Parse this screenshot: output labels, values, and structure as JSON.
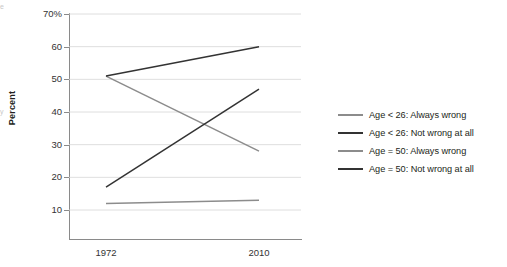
{
  "chart_data": {
    "type": "line",
    "title": "",
    "subtitle": "",
    "xlabel": "",
    "ylabel": "Percent",
    "x": [
      "1972",
      "2010"
    ],
    "categories": [
      "1972",
      "2010"
    ],
    "xlim": [
      0,
      1
    ],
    "ylim": [
      10,
      70
    ],
    "y_ticks": [
      10,
      20,
      30,
      40,
      50,
      60,
      70
    ],
    "y_tick_labels": [
      "10",
      "20",
      "30",
      "40",
      "50",
      "60",
      "70%"
    ],
    "x_tick_labels": [
      "1972",
      "2010"
    ],
    "grid": "horizontal",
    "legend_position": "right",
    "series": [
      {
        "name": "Age < 26: Always wrong",
        "color": "#8c8c8c",
        "values": [
          51,
          28
        ]
      },
      {
        "name": "Age < 26: Not wrong at all",
        "color": "#333333",
        "values": [
          17,
          47
        ]
      },
      {
        "name": "Age = 50: Always wrong",
        "color": "#8c8c8c",
        "values": [
          12,
          13
        ]
      },
      {
        "name": "Age = 50: Not wrong at all",
        "color": "#333333",
        "values": [
          51,
          60
        ]
      }
    ]
  },
  "axes": {
    "y_title": "Percent",
    "y_tick_labels": [
      "70%",
      "60",
      "50",
      "40",
      "30",
      "20",
      "10"
    ],
    "x_tick_labels": [
      "1972",
      "2010"
    ]
  },
  "legend": {
    "items": [
      {
        "label": "Age < 26: Always wrong",
        "color": "#8c8c8c"
      },
      {
        "label": "Age < 26: Not wrong at all",
        "color": "#333333"
      },
      {
        "label": "Age = 50: Always wrong",
        "color": "#8c8c8c"
      },
      {
        "label": "Age = 50: Not wrong at all",
        "color": "#333333"
      }
    ]
  },
  "edge_artifacts": {
    "top": "e",
    "middle": "y"
  },
  "colors": {
    "axis": "#8a8a8a",
    "grid": "#d6d6d6",
    "dark_series": "#333333",
    "light_series": "#8c8c8c",
    "text": "#231f20",
    "background": "#ffffff"
  }
}
